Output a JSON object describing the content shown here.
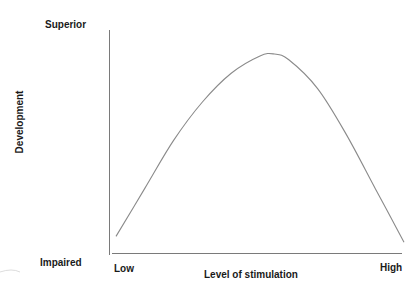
{
  "chart_data": {
    "type": "line",
    "title": "",
    "xlabel": "Level of stimulation",
    "ylabel": "Development",
    "x_tick_labels": [
      "Low",
      "High"
    ],
    "y_tick_labels": [
      "Impaired",
      "Superior"
    ],
    "grid": false,
    "legend": null,
    "series": [
      {
        "name": "Development",
        "x": [
          0.0,
          0.1,
          0.2,
          0.3,
          0.4,
          0.5,
          0.55,
          0.6,
          0.7,
          0.8,
          0.9,
          1.0
        ],
        "values": [
          0.05,
          0.3,
          0.55,
          0.75,
          0.9,
          0.99,
          1.0,
          0.97,
          0.82,
          0.58,
          0.3,
          0.02
        ]
      }
    ],
    "xlim": [
      0,
      1
    ],
    "ylim": [
      0,
      1
    ],
    "colors": {
      "line": "#8a8a8a",
      "axis": "#7a7a7a",
      "text": "#1a1a1a"
    }
  },
  "labels": {
    "y_top": "Superior",
    "y_bottom": "Impaired",
    "y_title": "Development",
    "x_left": "Low",
    "x_right": "High",
    "x_title": "Level of stimulation"
  }
}
